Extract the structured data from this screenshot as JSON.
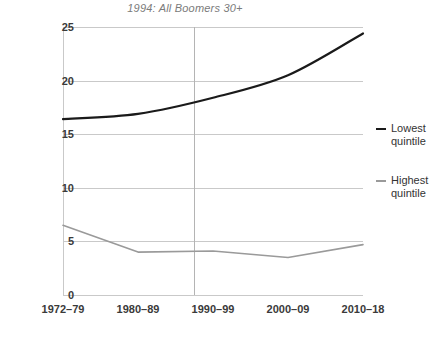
{
  "chart_data": {
    "type": "line",
    "title": "1994: All Boomers 30+",
    "xlabel": "",
    "ylabel": "",
    "categories": [
      "1972–79",
      "1980–89",
      "1990–99",
      "2000–09",
      "2010–18"
    ],
    "yticks": [
      0,
      5,
      10,
      15,
      20,
      25
    ],
    "ylim": [
      0,
      25
    ],
    "grid": "horizontal",
    "legend_position": "right",
    "annotations": [
      {
        "type": "vertical-reference-line",
        "label": "1994",
        "between_categories": [
          "1990–99"
        ],
        "x_fraction": 0.435
      }
    ],
    "series": [
      {
        "name": "Lowest quintile",
        "color": "#1a1a1a",
        "values": [
          16.4,
          16.9,
          18.4,
          20.5,
          24.4
        ]
      },
      {
        "name": "Highest quintile",
        "color": "#9a9a9a",
        "values": [
          6.5,
          4.0,
          4.1,
          3.5,
          4.7
        ]
      }
    ]
  },
  "legend": {
    "entries": [
      {
        "label_line1": "Lowest",
        "label_line2": "quintile",
        "color": "#1a1a1a"
      },
      {
        "label_line1": "Highest",
        "label_line2": "quintile",
        "color": "#9a9a9a"
      }
    ]
  },
  "colors": {
    "grid": "#c9c9c9",
    "reference_line": "#b4b4b4",
    "tick_text": "#3a3a3a",
    "title_text": "#7b7b7b",
    "background": "#ffffff"
  }
}
